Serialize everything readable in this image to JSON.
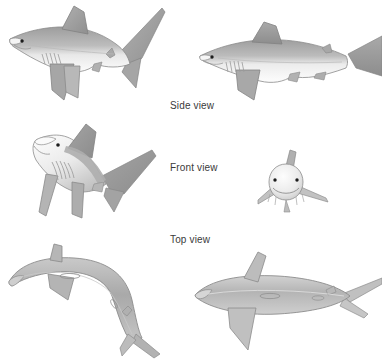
{
  "plate": {
    "title": "Shark anatomy orientation plate",
    "background_color": "#ffffff",
    "width": 382,
    "height": 362
  },
  "palette": {
    "outline": "#8d8d8d",
    "outline_dark": "#6f6f6f",
    "dorsal_dark": "#9a9a9a",
    "body_mid": "#b5b5b5",
    "body_light": "#d8d8d8",
    "belly_white": "#fbfbfb",
    "fin_grey": "#a8a8a8",
    "eye": "#1c1c1c",
    "label_text": "#3a3a3a"
  },
  "labels": [
    {
      "id": "side",
      "text": "Side view",
      "x": 170,
      "y": 100
    },
    {
      "id": "front",
      "text": "Front view",
      "x": 170,
      "y": 162
    },
    {
      "id": "top",
      "text": "Top view",
      "x": 170,
      "y": 234
    }
  ],
  "figures": [
    {
      "id": "side-oblique",
      "name": "shark-side-oblique",
      "view": "Side view",
      "orientation": "three-quarter side, head facing left",
      "row": 1,
      "column": "left",
      "x": 2,
      "y": 2,
      "width": 168,
      "height": 112
    },
    {
      "id": "side-lateral",
      "name": "shark-side-lateral",
      "view": "Side view",
      "orientation": "pure lateral, head facing left, tail cropped at right edge",
      "row": 1,
      "column": "right",
      "x": 196,
      "y": 18,
      "width": 186,
      "height": 92
    },
    {
      "id": "front-oblique",
      "name": "shark-front-oblique",
      "view": "Front view",
      "orientation": "front three-quarter, underside visible, pectoral fins spread",
      "row": 2,
      "column": "left",
      "x": 6,
      "y": 118,
      "width": 152,
      "height": 104
    },
    {
      "id": "front-head-on",
      "name": "shark-front-head-on",
      "view": "Front view",
      "orientation": "head-on frontal, both eyes visible",
      "row": 2,
      "column": "right",
      "x": 256,
      "y": 150,
      "width": 76,
      "height": 70
    },
    {
      "id": "top-curved",
      "name": "shark-top-curved",
      "view": "Top view",
      "orientation": "dorsal view, body curved, head at left",
      "row": 3,
      "column": "left",
      "x": 4,
      "y": 238,
      "width": 168,
      "height": 120
    },
    {
      "id": "top-straight",
      "name": "shark-top-straight",
      "view": "Top view",
      "orientation": "dorsal view, body straight, head at left, tail cropped right",
      "row": 3,
      "column": "right",
      "x": 192,
      "y": 250,
      "width": 190,
      "height": 106
    }
  ],
  "features": {
    "gill_slit_count": 5,
    "eye_count_front_view": 2,
    "eye_count_side_view": 1
  }
}
